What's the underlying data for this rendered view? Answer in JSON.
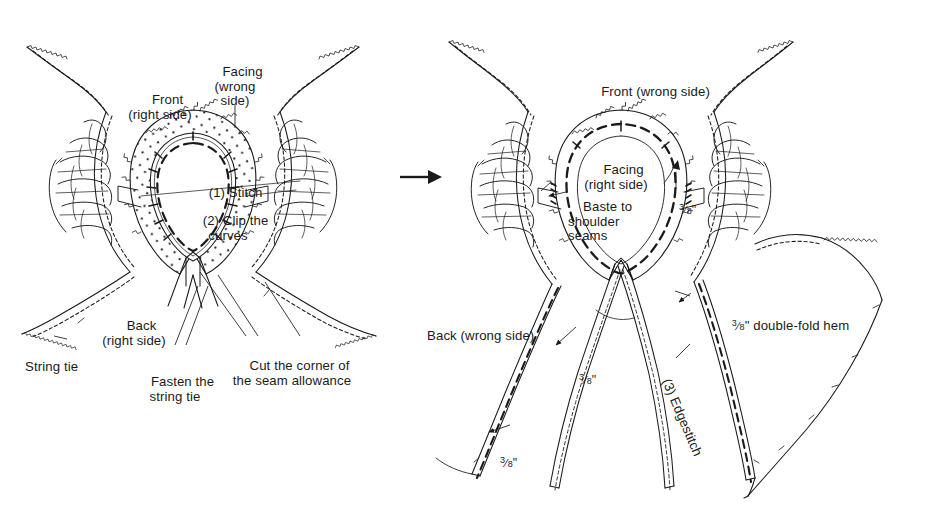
{
  "document": {
    "type": "sewing-instruction-diagram",
    "title": "Neckline facing and string tie construction",
    "background_color": "#ffffff",
    "ink_color": "#1a1a1a",
    "width": 952,
    "height": 524
  },
  "transition": {
    "arrow_icon": "right-arrow-icon",
    "label": "→"
  },
  "panels": [
    {
      "id": "left",
      "name": "step-1-2-panel",
      "caption": "Stitch and clip the neckline facing",
      "labels": [
        {
          "id": "front-right-side",
          "text": "Front\n(right side)",
          "x": 160,
          "y": 78,
          "align": "ctr"
        },
        {
          "id": "facing-wrong-side",
          "text": "Facing\n(wrong\nside)",
          "x": 235,
          "y": 50,
          "align": "ctr"
        },
        {
          "id": "step-1-stitch",
          "text": "(1) Stitch",
          "x": 228,
          "y": 171,
          "align": "ctr"
        },
        {
          "id": "step-2-clip",
          "text": "(2) Clip the\ncurves",
          "x": 228,
          "y": 199,
          "align": "ctr"
        },
        {
          "id": "back-right-side",
          "text": "Back\n(right side)",
          "x": 134,
          "y": 304,
          "align": "ctr"
        },
        {
          "id": "string-tie",
          "text": "String tie",
          "x": 10,
          "y": 345,
          "align": "lft"
        },
        {
          "id": "fasten-string-tie",
          "text": "Fasten the\nstring tie",
          "x": 175,
          "y": 360,
          "align": "ctr"
        },
        {
          "id": "cut-corner",
          "text": "Cut the corner of\nthe seam allowance",
          "x": 292,
          "y": 344,
          "align": "ctr"
        }
      ]
    },
    {
      "id": "right",
      "name": "step-3-panel",
      "caption": "Turn facing, baste to shoulder seams and edgestitch the hem",
      "labels": [
        {
          "id": "front-wrong-side",
          "text": "Front (wrong side)",
          "x": 648,
          "y": 70,
          "align": "ctr"
        },
        {
          "id": "facing-right-side",
          "text": "Facing\n(right side)",
          "x": 616,
          "y": 148,
          "align": "ctr"
        },
        {
          "id": "baste-shoulder",
          "text": "Baste to\nshoulder\nseams",
          "x": 568,
          "y": 185,
          "align": "lft"
        },
        {
          "id": "back-wrong-side",
          "text": "Back (wrong side)",
          "x": 412,
          "y": 314,
          "align": "lft"
        }
      ],
      "measurements": [
        {
          "id": "seam-allowance-neck",
          "value": "3/8",
          "unit": "\"",
          "x": 645,
          "y": 178
        },
        {
          "id": "seam-allowance-tie",
          "value": "3/8",
          "unit": "\"",
          "x": 545,
          "y": 348
        },
        {
          "id": "seam-allowance-hem-l",
          "value": "3/8",
          "unit": "\"",
          "x": 466,
          "y": 431
        }
      ],
      "annotations": [
        {
          "id": "double-fold-hem",
          "prefix": "3/8",
          "unit": "\"",
          "text": " double-fold hem",
          "x": 697,
          "y": 293
        },
        {
          "id": "step-3-edgestitch",
          "text": "(3) Edgestitch",
          "x": 680,
          "y": 357,
          "rotated": true,
          "rotation_deg": 67
        }
      ]
    }
  ]
}
